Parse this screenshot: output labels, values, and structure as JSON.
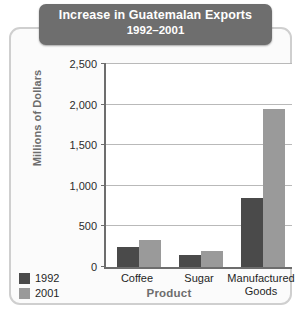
{
  "chart_data": {
    "type": "bar",
    "title": "Increase in Guatemalan Exports",
    "subtitle": "1992–2001",
    "xlabel": "Product",
    "ylabel": "Millions of Dollars",
    "categories": [
      "Coffee",
      "Sugar",
      "Manufactured Goods"
    ],
    "category_lines": [
      [
        "Coffee"
      ],
      [
        "Sugar"
      ],
      [
        "Manufactured",
        "Goods"
      ]
    ],
    "series": [
      {
        "name": "1992",
        "color": "#4a4a4a",
        "values": [
          250,
          150,
          850
        ]
      },
      {
        "name": "2001",
        "color": "#9a9a9a",
        "values": [
          330,
          200,
          1950
        ]
      }
    ],
    "ylim": [
      0,
      2500
    ],
    "yticks": [
      0,
      500,
      1000,
      1500,
      2000,
      2500
    ],
    "ytick_labels": [
      "0",
      "500",
      "1,000",
      "1,500",
      "2,000",
      "2,500"
    ],
    "grid": true,
    "legend_position": "bottom-left"
  },
  "colors": {
    "banner": "#6e6e6e",
    "banner_text": "#ffffff",
    "axis": "#6d6d6d",
    "gridline": "#b9b9b9",
    "frame": "#cfcfcf",
    "series_1992": "#4a4a4a",
    "series_2001": "#9a9a9a"
  }
}
